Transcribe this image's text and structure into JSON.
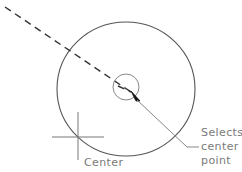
{
  "figure": {
    "background_color": "#ffffff",
    "line_color": "#555555",
    "text_color": "#7a7a7a"
  },
  "labels": {
    "center": "Center",
    "callout_line1": "Selects",
    "callout_line2": "center",
    "callout_line3": "point"
  },
  "shapes": {
    "main_circle": {
      "name": "main-circle",
      "cx": 126,
      "cy": 89,
      "rx": 69,
      "ry": 67
    },
    "snap_circle": {
      "name": "snap-marker-circle",
      "cx": 126,
      "cy": 87,
      "r": 13
    },
    "crosshair": {
      "name": "center-crosshair",
      "cx": 78,
      "cy": 137,
      "half_width": 26,
      "half_height": 24
    },
    "dashed_line": {
      "name": "rubber-band-dashed-line",
      "x1": 5,
      "y1": 7,
      "x2": 131,
      "y2": 92
    },
    "leader_line": {
      "name": "callout-leader-line",
      "x1": 136,
      "y1": 98,
      "x2": 187,
      "y2": 147,
      "tail_x": 198,
      "tail_y": 147
    },
    "cursor_arrow": {
      "name": "cursor-arrow-head",
      "x": 136,
      "y": 98
    }
  }
}
